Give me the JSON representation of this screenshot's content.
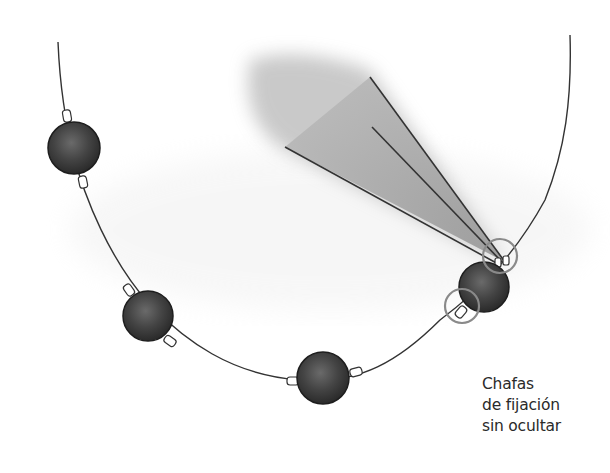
{
  "figure": {
    "strand": {
      "bead_count": 5,
      "bead_color": "#3a3a3a",
      "thread_color": "#333333"
    },
    "tool": "pliers-crimping",
    "highlight_circles": 2,
    "highlight_color": "#8a8a8a"
  },
  "caption": {
    "lines": [
      "Chafas",
      "de fijación",
      "sin ocultar"
    ]
  }
}
